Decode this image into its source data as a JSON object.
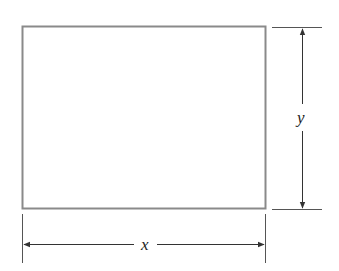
{
  "diagram": {
    "type": "rectangle-dimensions",
    "labels": {
      "width": "x",
      "height": "y"
    },
    "colors": {
      "rectangle_stroke": "#8a8a8a",
      "dimension_lines": "#333333",
      "background": "#ffffff"
    }
  }
}
